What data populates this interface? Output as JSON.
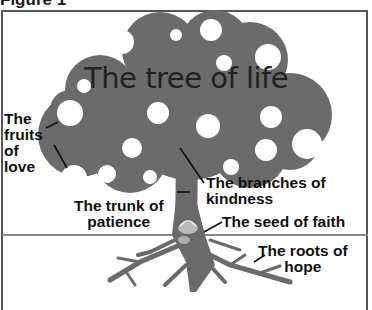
{
  "figure_label": "Figure 1",
  "diagram": {
    "title": "The tree of life",
    "colors": {
      "canopy": "#6b6b6b",
      "trunk": "#6a6a6a",
      "fruit": "#ffffff",
      "text": "#111111",
      "ground_line": "#888888"
    },
    "labels": {
      "fruits": "The\nfruits\nof\nlove",
      "branches": "The branches of\nkindness",
      "trunk": "The trunk of\npatience",
      "seed": "The seed of faith",
      "roots": "The roots of\nhope"
    }
  }
}
